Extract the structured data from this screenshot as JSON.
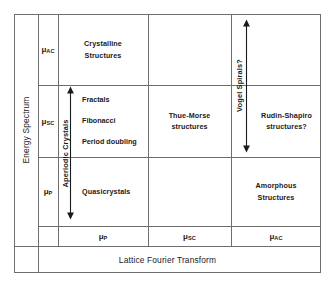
{
  "diagram": {
    "title_bottom": "Lattice Fourier Transform",
    "title_left": "Energy Spectrum",
    "energy_axis_ticks": [
      {
        "base": "μ",
        "sub": "AC"
      },
      {
        "base": "μ",
        "sub": "SC"
      },
      {
        "base": "μ",
        "sub": "P"
      }
    ],
    "lattice_axis_ticks": [
      {
        "base": "μ",
        "sub": "P"
      },
      {
        "base": "μ",
        "sub": "SC"
      },
      {
        "base": "μ",
        "sub": "AC"
      }
    ],
    "vertical_labels": {
      "aperiodic": "Aperiodic Crystals",
      "vogel": "Vogel Spirals?"
    },
    "cells": {
      "crystalline": "Crystalline\nStructures",
      "crystalline_line1": "Crystalline",
      "crystalline_line2": "Structures",
      "aperiodic_items": [
        "Fractals",
        "Fibonacci",
        "Period doubling"
      ],
      "quasicrystals": "Quasicrystals",
      "thue_morse_line1": "Thue-Morse",
      "thue_morse_line2": "structures",
      "rudin_shapiro_line1": "Rudin-Shapiro",
      "rudin_shapiro_line2": "structures?",
      "amorphous_line1": "Amorphous",
      "amorphous_line2": "Structures"
    },
    "colors": {
      "line": "#6e6e6e",
      "text": "#1a1a1a",
      "background": "#ffffff"
    }
  }
}
